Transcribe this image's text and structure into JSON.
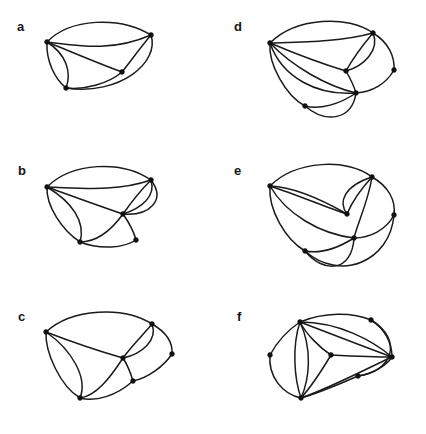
{
  "figure": {
    "width": 426,
    "height": 434,
    "background_color": "#ffffff",
    "ink_color": "#1a1a1a"
  },
  "panels": [
    {
      "id": "a",
      "label": "a",
      "label_x": 17,
      "label_y": 20,
      "origin_x": 0,
      "origin_y": 0,
      "vertex_count": 4,
      "edge_count": 7,
      "vertices": [
        {
          "name": "v1",
          "x": 47,
          "y": 42
        },
        {
          "name": "v2",
          "x": 151,
          "y": 35
        },
        {
          "name": "v3",
          "x": 122,
          "y": 72
        },
        {
          "name": "v4",
          "x": 66,
          "y": 88
        }
      ],
      "edges": [
        {
          "from": "v1",
          "to": "v2",
          "path": "M47,42 C70,18 120,16 151,35"
        },
        {
          "from": "v1",
          "to": "v2",
          "path": "M47,42 C80,46 112,52 151,35"
        },
        {
          "from": "v1",
          "to": "v3",
          "path": "M47,42 C72,52 100,64 122,72"
        },
        {
          "from": "v1",
          "to": "v4",
          "path": "M47,42 C46,60 54,78 66,88"
        },
        {
          "from": "v1",
          "to": "v4",
          "path": "M47,42 C66,54 72,72 66,88"
        },
        {
          "from": "v2",
          "to": "v3",
          "path": "M151,35 C140,48 130,62 122,72"
        },
        {
          "from": "v3",
          "to": "v4",
          "path": "M122,72 C108,84 84,90 66,88"
        },
        {
          "from": "v2",
          "to": "v4",
          "path": "M151,35 C160,62 120,96 66,88"
        }
      ]
    },
    {
      "id": "b",
      "label": "b",
      "label_x": 18,
      "label_y": 164,
      "origin_x": 0,
      "origin_y": 145,
      "vertex_count": 5,
      "edge_count": 9,
      "vertices": [
        {
          "name": "v1",
          "x": 47,
          "y": 187
        },
        {
          "name": "v2",
          "x": 151,
          "y": 180
        },
        {
          "name": "v3",
          "x": 123,
          "y": 214
        },
        {
          "name": "v4",
          "x": 80,
          "y": 242
        },
        {
          "name": "v5",
          "x": 136,
          "y": 240
        }
      ],
      "edges": [
        {
          "from": "v1",
          "to": "v2",
          "path": "M47,187 C72,162 122,160 151,180"
        },
        {
          "from": "v1",
          "to": "v2",
          "path": "M47,187 C82,188 116,192 151,180"
        },
        {
          "from": "v1",
          "to": "v3",
          "path": "M47,187 C72,196 102,207 123,214"
        },
        {
          "from": "v2",
          "to": "v3",
          "path": "M151,180 C140,191 130,204 123,214"
        },
        {
          "from": "v2",
          "to": "v3",
          "path": "M151,180 C156,196 142,208 123,214"
        },
        {
          "from": "v2",
          "to": "v3",
          "path": "M151,180 C166,200 150,216 123,214"
        },
        {
          "from": "v1",
          "to": "v4",
          "path": "M47,187 C46,206 62,230 80,242"
        },
        {
          "from": "v1",
          "to": "v4",
          "path": "M47,187 C72,202 86,222 80,242"
        },
        {
          "from": "v3",
          "to": "v4",
          "path": "M123,214 C110,232 96,242 80,242"
        },
        {
          "from": "v3",
          "to": "v5",
          "path": "M123,214 C130,224 134,232 136,240"
        },
        {
          "from": "v4",
          "to": "v5",
          "path": "M80,242 C100,250 124,248 136,240"
        }
      ]
    },
    {
      "id": "c",
      "label": "c",
      "label_x": 18,
      "label_y": 310,
      "origin_x": 0,
      "origin_y": 290,
      "vertex_count": 6,
      "edge_count": 9,
      "vertices": [
        {
          "name": "v1",
          "x": 46,
          "y": 332
        },
        {
          "name": "v2",
          "x": 152,
          "y": 324
        },
        {
          "name": "v3",
          "x": 123,
          "y": 358
        },
        {
          "name": "v4",
          "x": 172,
          "y": 354
        },
        {
          "name": "v5",
          "x": 133,
          "y": 381
        },
        {
          "name": "v6",
          "x": 80,
          "y": 398
        }
      ],
      "edges": [
        {
          "from": "v1",
          "to": "v2",
          "path": "M46,332 C72,308 124,306 152,324"
        },
        {
          "from": "v1",
          "to": "v3",
          "path": "M46,332 C72,342 102,352 123,358"
        },
        {
          "from": "v2",
          "to": "v3",
          "path": "M152,324 C142,336 130,348 123,358"
        },
        {
          "from": "v2",
          "to": "v3",
          "path": "M152,324 C158,340 142,354 123,358"
        },
        {
          "from": "v2",
          "to": "v4",
          "path": "M152,324 C166,332 173,342 172,354"
        },
        {
          "from": "v1",
          "to": "v6",
          "path": "M46,332 C45,352 60,386 80,398"
        },
        {
          "from": "v1",
          "to": "v6",
          "path": "M46,332 C72,350 88,378 80,398"
        },
        {
          "from": "v3",
          "to": "v6",
          "path": "M123,358 C110,378 96,396 80,398"
        },
        {
          "from": "v3",
          "to": "v5",
          "path": "M123,358 C128,366 131,374 133,381"
        },
        {
          "from": "v4",
          "to": "v5",
          "path": "M172,354 C164,366 148,378 133,381"
        },
        {
          "from": "v5",
          "to": "v6",
          "path": "M133,381 C116,396 96,402 80,398"
        }
      ]
    },
    {
      "id": "d",
      "label": "d",
      "label_x": 234,
      "label_y": 20,
      "origin_x": 213,
      "origin_y": 0,
      "vertex_count": 6,
      "edge_count": 10,
      "vertices": [
        {
          "name": "v1",
          "x": 270,
          "y": 43
        },
        {
          "name": "v2",
          "x": 373,
          "y": 33
        },
        {
          "name": "v3",
          "x": 346,
          "y": 71
        },
        {
          "name": "v4",
          "x": 394,
          "y": 70
        },
        {
          "name": "v5",
          "x": 356,
          "y": 93
        },
        {
          "name": "v6",
          "x": 305,
          "y": 106
        }
      ],
      "edges": [
        {
          "from": "v1",
          "to": "v2",
          "path": "M270,43 C296,17 348,15 373,33"
        },
        {
          "from": "v1",
          "to": "v2",
          "path": "M270,43 C304,42 340,42 373,33"
        },
        {
          "from": "v1",
          "to": "v3",
          "path": "M270,43 C296,54 326,65 346,71"
        },
        {
          "from": "v2",
          "to": "v3",
          "path": "M373,33 C362,46 352,60 346,71"
        },
        {
          "from": "v2",
          "to": "v3",
          "path": "M373,33 C380,50 364,66 346,71"
        },
        {
          "from": "v2",
          "to": "v4",
          "path": "M373,33 C388,42 395,56 394,70"
        },
        {
          "from": "v1",
          "to": "v6",
          "path": "M270,43 C268,64 286,96 305,106"
        },
        {
          "from": "v1",
          "to": "v5",
          "path": "M270,43 C292,66 326,86 356,93"
        },
        {
          "from": "v1",
          "to": "v5",
          "path": "M270,43 C282,78 318,96 356,93"
        },
        {
          "from": "v3",
          "to": "v5",
          "path": "M346,71 C350,78 354,86 356,93"
        },
        {
          "from": "v4",
          "to": "v5",
          "path": "M394,70 C386,84 372,92 356,93"
        },
        {
          "from": "v5",
          "to": "v6",
          "path": "M356,93 C340,104 320,110 305,106"
        },
        {
          "from": "v5",
          "to": "v6",
          "path": "M356,93 C352,120 326,124 305,106"
        }
      ]
    },
    {
      "id": "e",
      "label": "e",
      "label_x": 234,
      "label_y": 164,
      "origin_x": 213,
      "origin_y": 145,
      "vertex_count": 6,
      "edge_count": 11,
      "vertices": [
        {
          "name": "v1",
          "x": 270,
          "y": 186
        },
        {
          "name": "v2",
          "x": 372,
          "y": 177
        },
        {
          "name": "v3",
          "x": 347,
          "y": 214
        },
        {
          "name": "v4",
          "x": 394,
          "y": 215
        },
        {
          "name": "v5",
          "x": 354,
          "y": 238
        },
        {
          "name": "v6",
          "x": 305,
          "y": 251
        }
      ],
      "edges": [
        {
          "from": "v1",
          "to": "v2",
          "path": "M270,186 C296,160 348,158 372,177"
        },
        {
          "from": "v1",
          "to": "v3",
          "path": "M270,186 C296,187 326,202 347,214"
        },
        {
          "from": "v1",
          "to": "v3",
          "path": "M270,186 C300,196 328,208 347,214"
        },
        {
          "from": "v2",
          "to": "v3",
          "path": "M372,177 C360,190 352,202 347,214"
        },
        {
          "from": "v2",
          "to": "v3",
          "path": "M372,177 C344,186 338,202 347,214"
        },
        {
          "from": "v2",
          "to": "v4",
          "path": "M372,177 C388,186 396,200 394,215"
        },
        {
          "from": "v1",
          "to": "v6",
          "path": "M270,186 C268,210 286,240 305,251"
        },
        {
          "from": "v1",
          "to": "v5",
          "path": "M270,186 C286,214 320,234 354,238"
        },
        {
          "from": "v2",
          "to": "v5",
          "path": "M372,177 C368,202 358,222 354,238"
        },
        {
          "from": "v4",
          "to": "v5",
          "path": "M394,215 C386,230 370,238 354,238"
        },
        {
          "from": "v5",
          "to": "v6",
          "path": "M354,238 C338,248 320,254 305,251"
        },
        {
          "from": "v5",
          "to": "v6",
          "path": "M354,238 C352,272 324,274 305,251"
        },
        {
          "from": "v4",
          "to": "v6",
          "path": "M394,215 C390,262 340,282 305,251"
        }
      ]
    },
    {
      "id": "f",
      "label": "f",
      "label_x": 237,
      "label_y": 310,
      "origin_x": 213,
      "origin_y": 290,
      "vertex_count": 7,
      "edge_count": 12,
      "vertices": [
        {
          "name": "v1",
          "x": 300,
          "y": 322
        },
        {
          "name": "v2",
          "x": 371,
          "y": 320
        },
        {
          "name": "v3",
          "x": 270,
          "y": 355
        },
        {
          "name": "v4",
          "x": 331,
          "y": 355
        },
        {
          "name": "v5",
          "x": 392,
          "y": 357
        },
        {
          "name": "v6",
          "x": 301,
          "y": 398
        },
        {
          "name": "v7",
          "x": 358,
          "y": 376
        }
      ],
      "edges": [
        {
          "from": "v1",
          "to": "v2",
          "path": "M300,322 C324,312 352,312 371,320"
        },
        {
          "from": "v2",
          "to": "v5",
          "path": "M371,320 C384,328 392,342 392,357"
        },
        {
          "from": "v1",
          "to": "v3",
          "path": "M300,322 C288,330 277,342 270,355"
        },
        {
          "from": "v1",
          "to": "v4",
          "path": "M300,322 C306,334 320,348 331,355"
        },
        {
          "from": "v1",
          "to": "v5",
          "path": "M300,322 C326,332 362,346 392,357"
        },
        {
          "from": "v1",
          "to": "v5",
          "path": "M300,322 C338,322 372,340 392,357"
        },
        {
          "from": "v1",
          "to": "v6",
          "path": "M300,322 C292,346 294,378 301,398"
        },
        {
          "from": "v1",
          "to": "v6",
          "path": "M300,322 C312,348 310,378 301,398"
        },
        {
          "from": "v3",
          "to": "v6",
          "path": "M270,355 C268,376 282,394 301,398"
        },
        {
          "from": "v4",
          "to": "v5",
          "path": "M331,355 C352,356 374,357 392,357"
        },
        {
          "from": "v4",
          "to": "v6",
          "path": "M331,355 C322,370 310,388 301,398"
        },
        {
          "from": "v5",
          "to": "v6",
          "path": "M392,357 C368,368 330,388 301,398"
        },
        {
          "from": "v5",
          "to": "v7",
          "path": "M392,357 C386,366 372,374 358,376"
        },
        {
          "from": "v6",
          "to": "v7",
          "path": "M301,398 C322,392 344,382 358,376"
        },
        {
          "from": "v2",
          "to": "v7",
          "path": "M371,320 C404,340 392,372 358,376"
        }
      ]
    }
  ]
}
